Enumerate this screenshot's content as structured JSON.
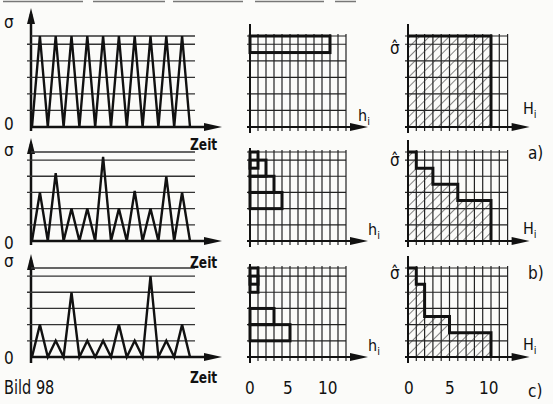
{
  "figure": {
    "caption": "Bild 98",
    "top_rule_segments": [
      [
        3,
        83
      ],
      [
        93,
        165
      ],
      [
        173,
        243
      ],
      [
        255,
        324
      ],
      [
        335,
        356
      ]
    ]
  },
  "labels": {
    "sigma": "σ",
    "sigma_hat": "σ̂",
    "time": "Zeit",
    "zero": "0",
    "h_i": "h",
    "h_sub": "i",
    "H_i": "H",
    "H_sub": "i",
    "ticks": [
      "0",
      "5",
      "10"
    ],
    "cases": [
      "a)",
      "b)",
      "c)"
    ]
  },
  "chart_data": [
    {
      "id": "a",
      "type": "line",
      "title": "Stress-time history a) (constant amplitude)",
      "xlabel": "Zeit",
      "ylabel": "σ",
      "levels": 6,
      "peaks": [
        5.5,
        5.5,
        5.5,
        5.5,
        5.5,
        5.5,
        5.5,
        5.5,
        5.5,
        5.5
      ]
    },
    {
      "id": "a_hist",
      "type": "bar",
      "title": "Class frequency h_i a)",
      "xlabel": "h_i",
      "xlim": [
        0,
        12
      ],
      "classes": [
        6,
        5,
        4,
        3,
        2,
        1
      ],
      "values": [
        10,
        0,
        0,
        0,
        0,
        0
      ]
    },
    {
      "id": "a_cum",
      "type": "area",
      "title": "Cumulative frequency H_i a)",
      "xlabel": "H_i",
      "ylabel": "σ̂",
      "xlim": [
        0,
        12
      ],
      "steps": [
        {
          "level": 5.5,
          "H": 10
        }
      ]
    },
    {
      "id": "b",
      "type": "line",
      "title": "Stress-time history b)",
      "xlabel": "Zeit",
      "ylabel": "σ",
      "levels": 6,
      "peaks": [
        3,
        4.2,
        2,
        2,
        5.2,
        2,
        3.1,
        2,
        4,
        3
      ]
    },
    {
      "id": "b_hist",
      "type": "bar",
      "title": "Class frequency h_i b)",
      "xlabel": "h_i",
      "xlim": [
        0,
        12
      ],
      "classes": [
        6,
        5,
        4,
        3,
        2,
        1
      ],
      "values": [
        1,
        2,
        3,
        4,
        0,
        0
      ]
    },
    {
      "id": "b_cum",
      "type": "area",
      "title": "Cumulative frequency H_i b)",
      "xlabel": "H_i",
      "ylabel": "σ̂",
      "xlim": [
        0,
        12
      ],
      "steps": [
        {
          "level": 5.5,
          "H": 1
        },
        {
          "level": 4.5,
          "H": 3
        },
        {
          "level": 3.5,
          "H": 6
        },
        {
          "level": 2.5,
          "H": 10
        }
      ]
    },
    {
      "id": "c",
      "type": "line",
      "title": "Stress-time history c)",
      "xlabel": "Zeit",
      "ylabel": "σ",
      "levels": 6,
      "peaks": [
        2,
        1,
        4,
        1,
        1,
        2,
        1,
        5,
        1,
        2
      ]
    },
    {
      "id": "c_hist",
      "type": "bar",
      "title": "Class frequency h_i c)",
      "xlabel": "h_i",
      "xlim": [
        0,
        12
      ],
      "classes": [
        6,
        5,
        4,
        3,
        2,
        1
      ],
      "values": [
        1,
        1,
        0,
        3,
        5,
        0
      ]
    },
    {
      "id": "c_cum",
      "type": "area",
      "title": "Cumulative frequency H_i c)",
      "xlabel": "H_i",
      "ylabel": "σ̂",
      "xlim": [
        0,
        12
      ],
      "xticks": [
        0,
        5,
        10
      ],
      "steps": [
        {
          "level": 5.5,
          "H": 1
        },
        {
          "level": 4.5,
          "H": 2
        },
        {
          "level": 2.5,
          "H": 5
        },
        {
          "level": 1.5,
          "H": 10
        }
      ]
    }
  ]
}
